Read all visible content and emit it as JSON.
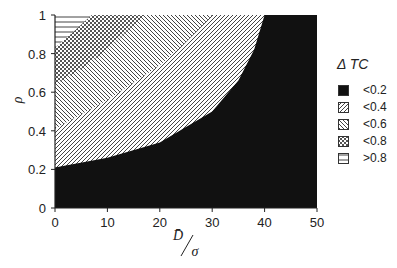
{
  "chart_data": {
    "type": "heatmap",
    "title": "",
    "xlabel": "D̄/σ",
    "ylabel": "ρ",
    "xlim": [
      0,
      50
    ],
    "ylim": [
      0,
      1
    ],
    "xticks": [
      0,
      10,
      20,
      30,
      40,
      50
    ],
    "yticks": [
      0,
      0.2,
      0.4,
      0.6,
      0.8,
      1
    ],
    "xtick_labels": [
      "0",
      "10",
      "20",
      "30",
      "40",
      "50"
    ],
    "ytick_labels": [
      "0",
      "0.2",
      "0.4",
      "0.6",
      "0.8",
      "1"
    ],
    "legend_title": "Δ TC",
    "legend_position": "right",
    "grid": false,
    "regions": [
      {
        "label": "<0.2",
        "pattern": "solid-black",
        "upper_boundary": [
          [
            0,
            0.21
          ],
          [
            10,
            0.26
          ],
          [
            20,
            0.34
          ],
          [
            30,
            0.5
          ],
          [
            35,
            0.66
          ],
          [
            38,
            0.82
          ],
          [
            40,
            1.0
          ]
        ]
      },
      {
        "label": "<0.4",
        "pattern": "diagonal-forward",
        "upper_boundary": [
          [
            0,
            0.41
          ],
          [
            10,
            0.56
          ],
          [
            20,
            0.74
          ],
          [
            25,
            0.86
          ],
          [
            30,
            1.0
          ]
        ]
      },
      {
        "label": "<0.6",
        "pattern": "diagonal-backward",
        "upper_boundary": [
          [
            0,
            0.64
          ],
          [
            5,
            0.72
          ],
          [
            10,
            0.82
          ],
          [
            17,
            1.0
          ]
        ]
      },
      {
        "label": "<0.8",
        "pattern": "crosshatch",
        "upper_boundary": [
          [
            0,
            0.83
          ],
          [
            3,
            0.9
          ],
          [
            7,
            1.0
          ]
        ]
      },
      {
        "label": ">0.8",
        "pattern": "horizontal",
        "upper_boundary": [
          [
            0,
            1.0
          ]
        ]
      }
    ]
  },
  "legend": {
    "title": "Δ TC",
    "items": [
      {
        "label": "<0.2",
        "pattern": "solid"
      },
      {
        "label": "<0.4",
        "pattern": "fwd"
      },
      {
        "label": "<0.6",
        "pattern": "bwd"
      },
      {
        "label": "<0.8",
        "pattern": "cross"
      },
      {
        "label": ">0.8",
        "pattern": "horiz"
      }
    ]
  },
  "axes": {
    "x_label_main": "D̄",
    "x_label_sub": "σ",
    "y_label": "ρ"
  }
}
